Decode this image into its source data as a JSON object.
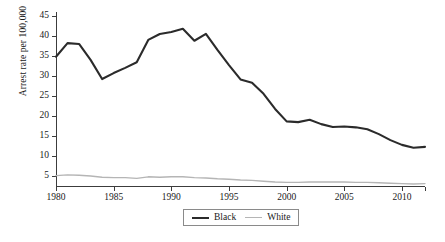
{
  "chart_data": {
    "type": "line",
    "title": "",
    "subtitle": "",
    "xlabel": "",
    "ylabel": "Arrest rate per 100,000",
    "xlim": [
      1980,
      2012
    ],
    "ylim": [
      2.4,
      46.0
    ],
    "yticks": [
      5,
      10,
      15,
      20,
      25,
      30,
      35,
      40,
      45
    ],
    "xticks": [
      1980,
      1985,
      1990,
      1995,
      2000,
      2005,
      2010
    ],
    "grid": false,
    "legend_position": "bottom",
    "x": [
      1980,
      1981,
      1982,
      1983,
      1984,
      1985,
      1986,
      1987,
      1988,
      1989,
      1990,
      1991,
      1992,
      1993,
      1994,
      1995,
      1996,
      1997,
      1998,
      1999,
      2000,
      2001,
      2002,
      2003,
      2004,
      2005,
      2006,
      2007,
      2008,
      2009,
      2010,
      2011,
      2012
    ],
    "series": [
      {
        "name": "Black",
        "color": "#2b2b2b",
        "values": [
          34.8,
          38.2,
          38.0,
          34.0,
          29.2,
          30.7,
          32.0,
          33.4,
          39.0,
          40.5,
          41.0,
          41.8,
          38.8,
          40.5,
          36.5,
          32.7,
          29.1,
          28.3,
          25.5,
          21.7,
          18.6,
          18.4,
          19.0,
          17.9,
          17.2,
          17.3,
          17.1,
          16.6,
          15.4,
          13.9,
          12.7,
          12.0,
          12.2
        ]
      },
      {
        "name": "White",
        "color": "#b5b5b5",
        "values": [
          5.0,
          5.2,
          5.1,
          4.9,
          4.6,
          4.5,
          4.5,
          4.3,
          4.7,
          4.6,
          4.7,
          4.7,
          4.5,
          4.4,
          4.2,
          4.1,
          3.9,
          3.8,
          3.6,
          3.4,
          3.3,
          3.3,
          3.4,
          3.4,
          3.4,
          3.4,
          3.3,
          3.3,
          3.2,
          3.1,
          3.0,
          2.9,
          3.0
        ]
      }
    ]
  },
  "legend": {
    "items": [
      {
        "label": "Black",
        "swatch": "line-swatch-black"
      },
      {
        "label": "White",
        "swatch": "line-swatch-white"
      }
    ]
  },
  "axis": {
    "y_label": "Arrest rate per 100,000",
    "y_tick_labels": [
      "45",
      "40",
      "35",
      "30",
      "25",
      "20",
      "15",
      "10",
      "5"
    ],
    "x_tick_labels": [
      "1980",
      "1985",
      "1990",
      "1995",
      "2000",
      "2005",
      "2010"
    ]
  },
  "colors": {
    "black_series": "#2b2b2b",
    "white_series": "#b5b5b5",
    "axis": "#3c3c3c",
    "background": "#ffffff"
  }
}
